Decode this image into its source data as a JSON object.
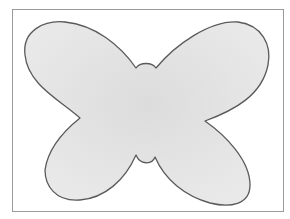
{
  "image": {
    "subject": "butterfly outline",
    "description": "Simple hand-drawn butterfly silhouette with four rounded wings and a small body, shaded light gray, inside a thin rectangular frame on white background."
  },
  "colors": {
    "background": "#ffffff",
    "frame": "#9a9a9a",
    "fill": "#e9e9e9",
    "fill_shade": "#dcdcdc",
    "outline": "#5a5a5a"
  },
  "shape": {
    "path": "M 80 118 C 60 100, 28 85, 25 55 C 22 30, 45 20, 65 22 C 95 25, 120 45, 136 68 C 140 62, 152 62, 156 68 C 175 45, 210 20, 238 22 C 262 25, 272 45, 268 65 C 262 95, 235 110, 205 121 C 225 135, 250 160, 250 185 C 250 205, 230 208, 210 203 C 185 196, 165 180, 155 157 C 152 165, 140 165, 136 155 C 125 180, 105 198, 80 200 C 55 202, 45 185, 45 170 C 48 148, 65 130, 80 118 Z"
  }
}
